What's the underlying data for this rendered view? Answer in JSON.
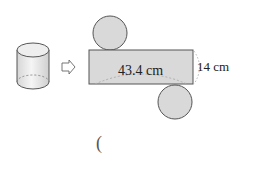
{
  "diagram": {
    "type": "cylinder-net",
    "arrow": "right-outline-arrow",
    "net": {
      "rectangle_width_label": "43.4 cm",
      "rectangle_height_label": "14 cm",
      "circles": 2
    },
    "answer_paren": "("
  },
  "colors": {
    "fill": "#d9d9d9",
    "stroke": "#555555",
    "dashed": "#999999"
  }
}
